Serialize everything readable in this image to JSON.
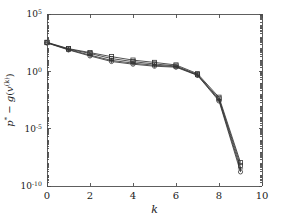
{
  "figure": {
    "background_color": "#ffffff",
    "line_color": "#333333",
    "axis_color": "#4d4d4d"
  },
  "axis": {
    "x_title": "k",
    "y_title_parts": {
      "p": "p",
      "star": "*",
      "minus": " − ",
      "g": "g",
      "open": "(",
      "v": "v",
      "exponent": "(k)",
      "close": ")"
    },
    "x_tick_labels": [
      "0",
      "2",
      "4",
      "6",
      "8",
      "10"
    ],
    "y_tick_labels": [
      {
        "base": "10",
        "exp": "5"
      },
      {
        "base": "10",
        "exp": "0"
      },
      {
        "base": "10",
        "exp": "-5"
      },
      {
        "base": "10",
        "exp": "-10"
      }
    ]
  },
  "chart_data": {
    "type": "line",
    "title": "",
    "xlabel": "k",
    "ylabel": "p* - g(v^(k))",
    "xlim": [
      0,
      10
    ],
    "ylim": [
      1e-10,
      100000.0
    ],
    "yscale": "log",
    "xscale": "linear",
    "grid": false,
    "legend": false,
    "x_ticks": [
      0,
      2,
      4,
      6,
      8,
      10
    ],
    "y_ticks": [
      100000,
      1,
      1e-05,
      1e-10
    ],
    "x": [
      0,
      1,
      2,
      3,
      4,
      5,
      6,
      7,
      8,
      9
    ],
    "series": [
      {
        "name": "run-1",
        "marker": "square",
        "values": [
          340.0,
          95.0,
          43.0,
          19.0,
          9.5,
          6.0,
          3.6,
          0.62,
          0.0055,
          1.1e-08
        ]
      },
      {
        "name": "run-2",
        "marker": "square",
        "values": [
          320.0,
          88.0,
          36.0,
          13.0,
          7.0,
          4.4,
          2.9,
          0.52,
          0.004,
          6.2e-09
        ]
      },
      {
        "name": "run-3",
        "marker": "plus",
        "values": [
          310.0,
          80.0,
          26.0,
          9.0,
          5.2,
          3.4,
          2.6,
          0.47,
          0.0033,
          3.1e-09
        ]
      },
      {
        "name": "run-4",
        "marker": "circle",
        "values": [
          300.0,
          74.0,
          22.0,
          7.2,
          4.2,
          2.8,
          2.3,
          0.44,
          0.0026,
          1.7e-09
        ]
      }
    ],
    "annotations": [
      {
        "text": "knee at k = 7",
        "x": 7
      }
    ]
  }
}
